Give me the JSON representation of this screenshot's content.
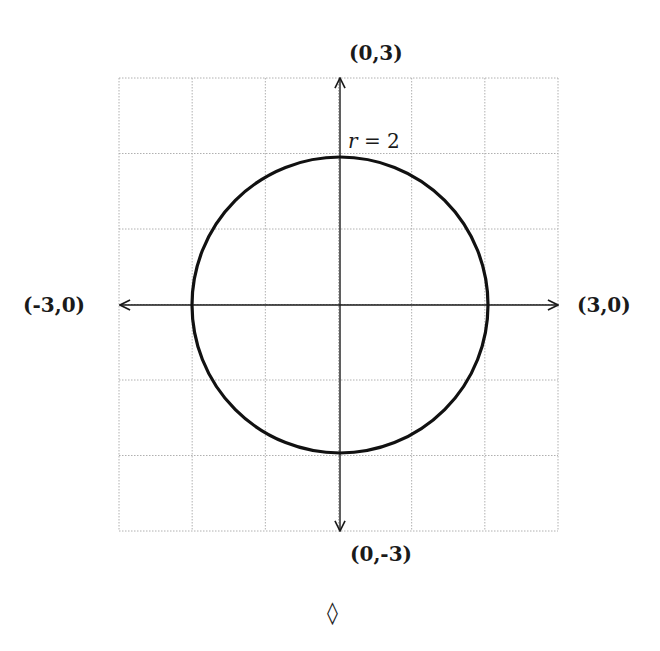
{
  "diagram": {
    "type": "circle-on-grid",
    "grid": {
      "x_range": [
        -3,
        3
      ],
      "y_range": [
        -3,
        3
      ],
      "step": 1,
      "line_style": "dotted",
      "color": "#b0b0b0"
    },
    "axes": {
      "color": "#1a1a1a",
      "labels": {
        "top": "(0,3)",
        "bottom": "(0,-3)",
        "left": "(-3,0)",
        "right": "(3,0)"
      }
    },
    "circle": {
      "center": [
        0,
        0
      ],
      "radius": 2,
      "color": "#111111",
      "label_var": "r",
      "label_eq": " = 2"
    },
    "footer_symbol": "◊"
  }
}
